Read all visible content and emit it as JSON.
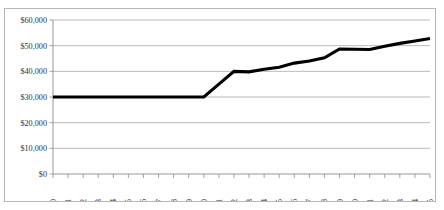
{
  "chart_data": {
    "type": "line",
    "title": "",
    "subtitle": "",
    "xlabel": "",
    "ylabel": "",
    "categories": [
      "1990",
      "1991",
      "1992",
      "1993",
      "1994",
      "1995",
      "1996",
      "1997",
      "1998",
      "1999",
      "2000",
      "2001",
      "2002",
      "2003",
      "2004",
      "2005",
      "2006",
      "2007",
      "2008",
      "2009",
      "2010",
      "2011",
      "2012",
      "2013",
      "2014",
      "2015"
    ],
    "values": [
      30000,
      30000,
      30000,
      30000,
      30000,
      30000,
      30000,
      30000,
      30000,
      30000,
      30000,
      35000,
      40000,
      39800,
      40800,
      41600,
      43200,
      44000,
      45300,
      48700,
      48600,
      48500,
      49800,
      50900,
      51800,
      52800
    ],
    "series": [
      {
        "name": "",
        "values": [
          30000,
          30000,
          30000,
          30000,
          30000,
          30000,
          30000,
          30000,
          30000,
          30000,
          30000,
          35000,
          40000,
          39800,
          40800,
          41600,
          43200,
          44000,
          45300,
          48700,
          48600,
          48500,
          49800,
          50900,
          51800,
          52800
        ]
      }
    ],
    "ylim": [
      0,
      60000
    ],
    "yticks": [
      0,
      10000,
      20000,
      30000,
      40000,
      50000,
      60000
    ],
    "ytick_labels": [
      "$0",
      "$10,000",
      "$20,000",
      "$30,000",
      "$40,000",
      "$50,000",
      "$60,000"
    ],
    "grid": "horizontal",
    "legend": "none",
    "line_color": "#000000",
    "gridline_color": "#a8a8a8",
    "border_color": "#b7b7b7",
    "markers": "none",
    "xtick_label_rotation": -90
  }
}
